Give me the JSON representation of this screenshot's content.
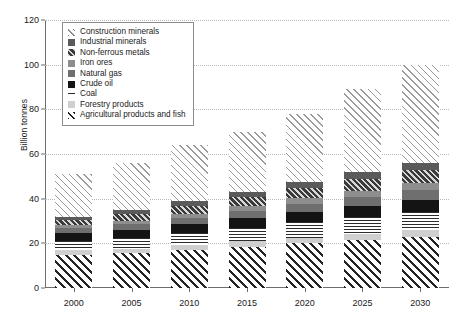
{
  "chart_data": {
    "type": "bar",
    "stacked": true,
    "title": "",
    "xlabel": "",
    "ylabel": "Billion tonnes",
    "ylim": [
      0,
      120
    ],
    "ytick_step": 20,
    "yticks": [
      "0",
      "20",
      "40",
      "60",
      "80",
      "100",
      "120"
    ],
    "grid": true,
    "legend_position": "upper-left-inside",
    "categories": [
      "2000",
      "2005",
      "2010",
      "2015",
      "2020",
      "2025",
      "2030"
    ],
    "series": [
      {
        "name": "Agricultural products and fish",
        "pattern": "agri",
        "values": [
          15.0,
          15.5,
          17.0,
          18.5,
          20.0,
          21.5,
          23.0
        ]
      },
      {
        "name": "Forestry products",
        "pattern": "forestry",
        "values": [
          2.0,
          2.1,
          2.2,
          2.4,
          2.6,
          2.8,
          3.0
        ]
      },
      {
        "name": "Coal",
        "pattern": "coal",
        "values": [
          4.0,
          4.6,
          5.3,
          6.0,
          6.8,
          7.5,
          8.2
        ]
      },
      {
        "name": "Crude oil",
        "pattern": "crudeoil",
        "values": [
          3.6,
          3.9,
          4.2,
          4.5,
          4.8,
          5.1,
          5.4
        ]
      },
      {
        "name": "Natural gas",
        "pattern": "naturalgas",
        "values": [
          2.2,
          2.5,
          2.8,
          3.2,
          3.6,
          4.0,
          4.4
        ]
      },
      {
        "name": "Iron ores",
        "pattern": "ironores",
        "values": [
          1.2,
          1.5,
          1.8,
          2.1,
          2.4,
          2.7,
          3.0
        ]
      },
      {
        "name": "Non-ferrous metals",
        "pattern": "nonferrous",
        "values": [
          2.6,
          3.0,
          3.5,
          4.0,
          4.5,
          5.1,
          5.7
        ]
      },
      {
        "name": "Industrial minerals",
        "pattern": "industrial",
        "values": [
          1.4,
          1.7,
          2.0,
          2.3,
          2.7,
          3.1,
          3.5
        ]
      },
      {
        "name": "Construction minerals",
        "pattern": "construction",
        "values": [
          19.0,
          21.2,
          25.2,
          27.0,
          30.6,
          37.3,
          43.8
        ]
      }
    ],
    "totals": [
      51,
      56,
      64,
      70,
      78,
      89,
      100
    ]
  },
  "legend": {
    "items": [
      {
        "label": "Construction minerals",
        "pattern": "construction"
      },
      {
        "label": "Industrial minerals",
        "pattern": "industrial"
      },
      {
        "label": "Non-ferrous metals",
        "pattern": "nonferrous"
      },
      {
        "label": "Iron ores",
        "pattern": "ironores"
      },
      {
        "label": "Natural gas",
        "pattern": "naturalgas"
      },
      {
        "label": "Crude oil",
        "pattern": "crudeoil"
      },
      {
        "label": "Coal",
        "pattern": "coal"
      },
      {
        "label": "Forestry products",
        "pattern": "forestry"
      },
      {
        "label": "Agricultural products and fish",
        "pattern": "agri"
      }
    ]
  },
  "colors": {
    "axis": "#6d6d6d",
    "grid": "#b9b9b9",
    "text": "#1a1a1a",
    "legend_border": "#8d8d8d",
    "background": "#ffffff"
  }
}
